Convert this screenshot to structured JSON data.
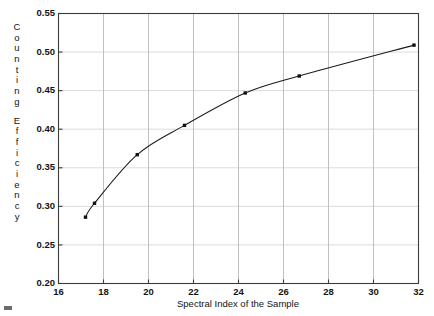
{
  "chart_data": {
    "type": "line",
    "title": "",
    "subtitle": "",
    "xlabel": "Spectral Index of the Sample",
    "ylabel": "Counting Efficiency",
    "ylabel_chars": [
      "C",
      "o",
      "u",
      "n",
      "t",
      "i",
      "n",
      "g",
      "",
      "E",
      "f",
      "f",
      "i",
      "c",
      "i",
      "e",
      "n",
      "c",
      "y"
    ],
    "xlim": [
      16,
      32
    ],
    "ylim": [
      0.2,
      0.55
    ],
    "xticks": [
      16,
      18,
      20,
      22,
      24,
      26,
      28,
      30,
      32
    ],
    "xtick_labels": [
      "16",
      "18",
      "20",
      "22",
      "24",
      "26",
      "28",
      "30",
      "32"
    ],
    "yticks": [
      0.2,
      0.25,
      0.3,
      0.35,
      0.4,
      0.45,
      0.5,
      0.55
    ],
    "ytick_labels": [
      "0.20",
      "0.25",
      "0.30",
      "0.35",
      "0.40",
      "0.45",
      "0.50",
      "0.55"
    ],
    "grid": true,
    "legend": "none",
    "marker": "filled-square",
    "line_style": "solid",
    "series": [
      {
        "name": "Counting Efficiency vs Spectral Index",
        "x": [
          17.2,
          17.6,
          19.5,
          21.6,
          24.3,
          26.7,
          31.8
        ],
        "y": [
          0.286,
          0.304,
          0.367,
          0.405,
          0.447,
          0.469,
          0.509
        ]
      }
    ],
    "colors": {
      "line": "#1a1a1a",
      "marker": "#111111",
      "grid": "#c8c8c8",
      "axis": "#3c3c3c",
      "background": "#ffffff",
      "text": "#141414"
    }
  }
}
